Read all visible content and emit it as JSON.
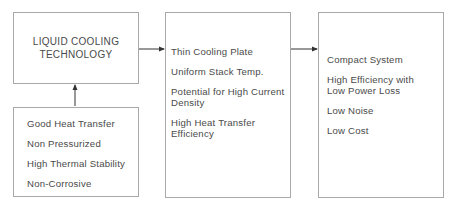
{
  "diagram": {
    "title_box": {
      "lines": [
        "LIQUID COOLING",
        "TECHNOLOGY"
      ]
    },
    "properties_box": {
      "items": [
        "Good Heat Transfer",
        "Non Pressurized",
        "High Thermal Stability",
        "Non-Corrosive"
      ]
    },
    "benefits_box": {
      "items": [
        [
          "Thin Cooling Plate"
        ],
        [
          "Uniform Stack Temp."
        ],
        [
          "Potential for High Current",
          "Density"
        ],
        [
          "High Heat Transfer",
          "Efficiency"
        ]
      ]
    },
    "outcomes_box": {
      "items": [
        [
          "Compact System"
        ],
        [
          "High Efficiency with",
          "Low Power Loss"
        ],
        [
          "Low Noise"
        ],
        [
          "Low Cost"
        ]
      ]
    },
    "colors": {
      "border": "#a9a9a9",
      "text": "#4a4a4a",
      "arrow": "#333333"
    }
  }
}
